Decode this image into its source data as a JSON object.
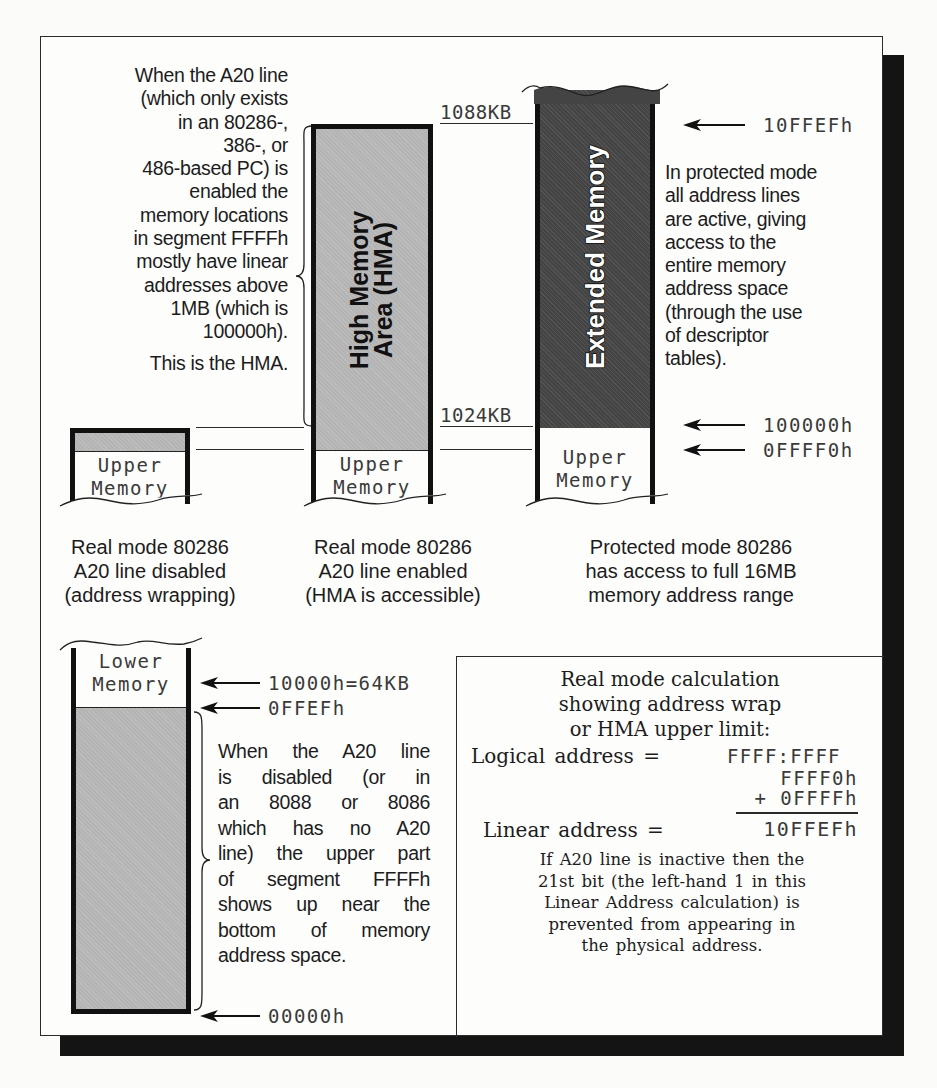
{
  "top_section": {
    "hma_note": {
      "lines": [
        "When the A20 line",
        "(which only exists",
        "in an 80286-,",
        "386-, or",
        "486-based PC) is",
        "enabled the",
        "memory locations",
        "in segment FFFFh",
        "mostly have linear",
        "addresses above",
        "1MB (which is",
        "100000h)."
      ],
      "conclusion": "This is the HMA."
    },
    "col1": {
      "upper_label_line1": "Upper",
      "upper_label_line2": "Memory",
      "caption": [
        "Real mode 80286",
        "A20 line disabled",
        "(address wrapping)"
      ]
    },
    "col2": {
      "region_label_line1": "High Memory",
      "region_label_line2": "Area (HMA)",
      "upper_label_line1": "Upper",
      "upper_label_line2": "Memory",
      "caption": [
        "Real mode 80286",
        "A20 line enabled",
        "(HMA is accessible)"
      ],
      "top_marker": "1088KB",
      "bottom_marker": "1024KB"
    },
    "col3": {
      "region_label": "Extended Memory",
      "upper_label_line1": "Upper",
      "upper_label_line2": "Memory",
      "caption": [
        "Protected mode 80286",
        "has access to full 16MB",
        "memory address range"
      ]
    },
    "addresses": {
      "top": "10FFEFh",
      "mid": "100000h",
      "low": "0FFFF0h"
    },
    "protected_note": [
      "In protected mode",
      "all address lines",
      "are active, giving",
      "access to the",
      "entire memory",
      "address space",
      "(through the use",
      "of descriptor",
      "tables)."
    ]
  },
  "bottom_section": {
    "lower_label_line1": "Lower",
    "lower_label_line2": "Memory",
    "addresses": {
      "top": "10000h=64KB",
      "mid": "0FFEFh",
      "bottom": "00000h"
    },
    "wrap_note": [
      "When the A20 line",
      "is disabled (or in",
      "an 8088 or 8086",
      "which has no A20",
      "line) the upper part",
      "of segment FFFFh",
      "shows up near the",
      "bottom of memory",
      "address space."
    ]
  },
  "calc_box": {
    "title": [
      "Real mode calculation",
      "showing address wrap",
      "or HMA upper limit:"
    ],
    "logical_label": "Logical address =",
    "logical_value": "FFFF:FFFF",
    "addend1": "FFFF0h",
    "addend2": "+ 0FFFFh",
    "linear_label": "Linear address =",
    "linear_value": "10FFEFh",
    "note": [
      "If A20 line is inactive then the",
      "21st bit (the left-hand 1 in this",
      "Linear Address calculation) is",
      "prevented from appearing in",
      "the physical address."
    ]
  },
  "colors": {
    "hma_fill": "#b4b4b4",
    "extended_fill": "#444444",
    "shadow": "#141414"
  }
}
